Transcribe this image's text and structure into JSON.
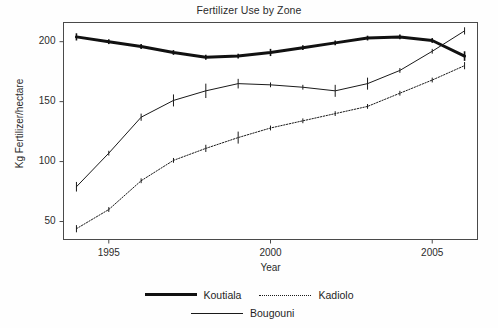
{
  "chart_data": {
    "type": "line",
    "title": "Fertilizer Use by Zone",
    "xlabel": "Year",
    "ylabel": "Kg Fertilizer/hectare",
    "xlim": [
      1993.6,
      2006.4
    ],
    "ylim": [
      35,
      216
    ],
    "xticks": [
      1995,
      2000,
      2005
    ],
    "yticks": [
      50,
      100,
      150,
      200
    ],
    "grid": false,
    "legend_position": "bottom",
    "x": [
      1994,
      1995,
      1996,
      1997,
      1998,
      1999,
      2000,
      2001,
      2002,
      2003,
      2004,
      2005,
      2006
    ],
    "series": [
      {
        "name": "Koutiala",
        "style": "thick-solid",
        "color": "#111111",
        "values": [
          204,
          200,
          196,
          191,
          187,
          188,
          191,
          195,
          199,
          203,
          204,
          201,
          188
        ],
        "errors": [
          3,
          2,
          2,
          2,
          2,
          2,
          3,
          2,
          2,
          2,
          2,
          2,
          4
        ]
      },
      {
        "name": "Kadiolo",
        "style": "dotted",
        "color": "#1a1a1a",
        "values": [
          44,
          60,
          84,
          101,
          111,
          120,
          128,
          134,
          140,
          146,
          157,
          168,
          180
        ],
        "errors": [
          3,
          2,
          2,
          2,
          3,
          5,
          2,
          2,
          2,
          2,
          2,
          2,
          3
        ]
      },
      {
        "name": "Bougouni",
        "style": "thin-solid",
        "color": "#1a1a1a",
        "values": [
          79,
          107,
          137,
          151,
          159,
          165,
          164,
          162,
          159,
          165,
          176,
          192,
          209
        ],
        "errors": [
          4,
          2,
          3,
          5,
          6,
          4,
          2,
          2,
          5,
          5,
          2,
          2,
          3
        ]
      }
    ]
  },
  "legend": {
    "rows": [
      [
        {
          "label": "Koutiala",
          "style": "thick-solid"
        },
        {
          "label": "Kadiolo",
          "style": "dotted"
        }
      ],
      [
        {
          "label": "Bougouni",
          "style": "thin-solid"
        }
      ]
    ]
  }
}
